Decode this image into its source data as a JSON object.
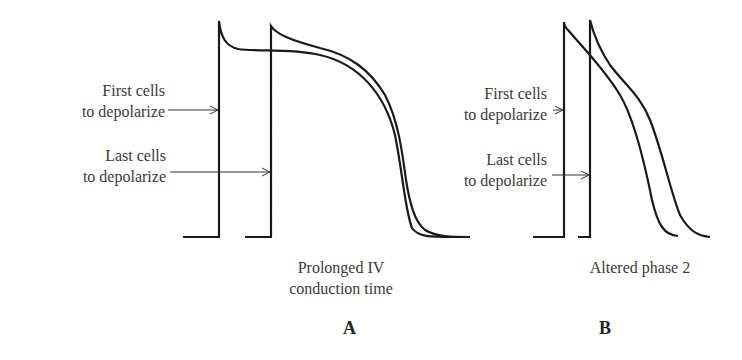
{
  "panels": [
    {
      "letter": "A",
      "caption_line1": "Prolonged IV",
      "caption_line2": "conduction time",
      "label_first": [
        "First cells",
        "to depolarize"
      ],
      "label_last": [
        "Last cells",
        "to depolarize"
      ]
    },
    {
      "letter": "B",
      "caption_line1": "Altered phase 2",
      "label_first": [
        "First cells",
        "to depolarize"
      ],
      "label_last": [
        "Last cells",
        "to depolarize"
      ]
    }
  ],
  "colors": {
    "stroke": "#1a1a1a",
    "text": "#3a3a3a",
    "background": "#ffffff"
  }
}
